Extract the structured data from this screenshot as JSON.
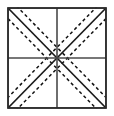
{
  "figure": {
    "name": "square-with-diagonals-and-dashed-parallels",
    "canvas": {
      "width": 114,
      "height": 116,
      "background": "#ffffff"
    },
    "colors": {
      "stroke": "#1a1a1a",
      "frame": "#2b2b2b",
      "midline": "#4a4a4a",
      "dashed": "#111111",
      "background": "#ffffff"
    },
    "frame": {
      "label": "outer square border",
      "x": 8,
      "y": 8,
      "width": 98,
      "height": 100,
      "stroke_width": 1.6
    },
    "midlines": {
      "vertical": {
        "label": "vertical center line",
        "x": 57,
        "y1": 8,
        "y2": 108,
        "stroke_width": 1.6
      },
      "horizontal": {
        "label": "horizontal center line",
        "y": 58,
        "x1": 8,
        "x2": 106,
        "stroke_width": 1.6
      }
    },
    "center_point": {
      "label": "convergence point",
      "x": 57,
      "y": 58
    },
    "diagonals": [
      {
        "label": "main diagonal top-left to bottom-right",
        "x1": 8,
        "y1": 8,
        "x2": 106,
        "y2": 108,
        "stroke_width": 1.7
      },
      {
        "label": "anti diagonal top-right to bottom-left",
        "x1": 106,
        "y1": 8,
        "x2": 8,
        "y2": 108,
        "stroke_width": 1.7
      }
    ],
    "dashed_lines": {
      "label": "dashed parallels flanking each diagonal",
      "dash_pattern": "3.2 2.8",
      "stroke_width": 1.5,
      "offset": 7.5,
      "count_per_diagonal": 2,
      "total": 4
    },
    "quadrants": [
      {
        "name": "top-left",
        "diagonal": "main",
        "dashed_parallels": 2
      },
      {
        "name": "top-right",
        "diagonal": "anti",
        "dashed_parallels": 2
      },
      {
        "name": "bottom-left",
        "diagonal": "anti",
        "dashed_parallels": 2
      },
      {
        "name": "bottom-right",
        "diagonal": "main",
        "dashed_parallels": 2
      }
    ]
  }
}
